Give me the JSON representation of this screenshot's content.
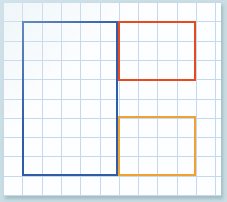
{
  "figure": {
    "paper": {
      "background_color": "#fdfeff",
      "frame_color": "#c9dde3",
      "grid_color": "#c8d8ec",
      "cell_size_px": 19.3,
      "columns": 11,
      "rows": 10
    },
    "shapes": [
      {
        "name": "blue-rectangle",
        "color": "#2f5ca8",
        "stroke_width_px": 2,
        "grid_origin_col": 1,
        "grid_origin_row": 1,
        "grid_width_cells": 5,
        "grid_height_cells": 8,
        "x": 19,
        "y": 19,
        "width": 96,
        "height": 155
      },
      {
        "name": "red-rectangle",
        "color": "#e8491f",
        "stroke_width_px": 2,
        "grid_origin_col": 6,
        "grid_origin_row": 1,
        "grid_width_cells": 4,
        "grid_height_cells": 3,
        "x": 115,
        "y": 19,
        "width": 78,
        "height": 60
      },
      {
        "name": "orange-rectangle",
        "color": "#f0a132",
        "stroke_width_px": 2,
        "grid_origin_col": 6,
        "grid_origin_row": 6,
        "grid_width_cells": 4,
        "grid_height_cells": 3,
        "x": 115,
        "y": 114,
        "width": 78,
        "height": 60
      }
    ]
  }
}
